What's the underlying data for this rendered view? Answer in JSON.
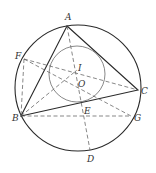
{
  "diagram": {
    "type": "geometry",
    "circumcircle": {
      "cx": 78,
      "cy": 88,
      "r": 63
    },
    "incircle": {
      "cx": 77,
      "cy": 74,
      "r": 28
    },
    "points": {
      "A": {
        "label": "A",
        "x": 67,
        "y": 26
      },
      "B": {
        "label": "B",
        "x": 21,
        "y": 116
      },
      "C": {
        "label": "C",
        "x": 138,
        "y": 90
      },
      "D": {
        "label": "D",
        "x": 90,
        "y": 150
      },
      "E": {
        "label": "E",
        "x": 82,
        "y": 104
      },
      "F": {
        "label": "F",
        "x": 24,
        "y": 59
      },
      "G": {
        "label": "G",
        "x": 131,
        "y": 116
      },
      "I": {
        "label": "I",
        "x": 77,
        "y": 70
      },
      "O": {
        "label": "O",
        "x": 79,
        "y": 80
      }
    },
    "labels": [
      "A",
      "B",
      "C",
      "D",
      "E",
      "F",
      "G",
      "I",
      "O"
    ]
  }
}
